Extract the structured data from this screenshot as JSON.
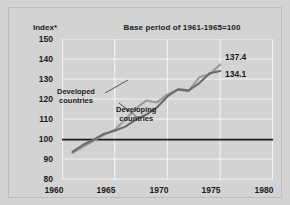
{
  "chart_data": {
    "type": "line",
    "title": "Base period of 1961-1965=100",
    "ylabel": "Index*",
    "xlabel": "",
    "xlim": [
      1960,
      1980
    ],
    "ylim": [
      80,
      150
    ],
    "ytick_labels": [
      "150",
      "140",
      "130",
      "120",
      "110",
      "100",
      "90",
      "80"
    ],
    "yticks": [
      150,
      140,
      130,
      120,
      110,
      100,
      90,
      80
    ],
    "xtick_labels": [
      "1960",
      "1965",
      "1970",
      "1975",
      "1980"
    ],
    "xticks": [
      1960,
      1965,
      1970,
      1975,
      1980
    ],
    "grid": true,
    "legend_position": "inline-annotations",
    "baseline": 100,
    "baseline_color": "#1a1a1a",
    "series": [
      {
        "name": "Developed countries",
        "color": "#9a9a9a",
        "label_text_line1": "Developed",
        "label_text_line2": "countries",
        "end_value_label": "137.4",
        "x": [
          1961,
          1962,
          1963,
          1964,
          1965,
          1966,
          1967,
          1968,
          1969,
          1970,
          1971,
          1972,
          1973,
          1974,
          1975
        ],
        "values": [
          93.5,
          96.5,
          99.5,
          102.5,
          105.0,
          110.0,
          115.5,
          119.5,
          118.5,
          122.5,
          125.0,
          124.0,
          131.0,
          132.5,
          137.4
        ]
      },
      {
        "name": "Developing countries",
        "color": "#6b6b6b",
        "label_text_line1": "Developing",
        "label_text_line2": "countries",
        "end_value_label": "134.1",
        "x": [
          1961,
          1962,
          1963,
          1964,
          1965,
          1966,
          1967,
          1968,
          1969,
          1970,
          1971,
          1972,
          1973,
          1974,
          1975
        ],
        "values": [
          94.0,
          97.5,
          100.0,
          103.0,
          104.5,
          106.5,
          110.0,
          112.5,
          116.0,
          121.5,
          125.0,
          124.5,
          128.0,
          133.0,
          134.1
        ]
      }
    ]
  },
  "labels": {
    "y_axis_caption": "Index*",
    "title": "Base period of 1961-1965=100",
    "ytick_0": "150",
    "ytick_1": "140",
    "ytick_2": "130",
    "ytick_3": "120",
    "ytick_4": "110",
    "ytick_5": "100",
    "ytick_6": "90",
    "ytick_7": "80",
    "xtick_0": "1960",
    "xtick_1": "1965",
    "xtick_2": "1970",
    "xtick_3": "1975",
    "xtick_4": "1980",
    "developed_line1": "Developed",
    "developed_line2": "countries",
    "developing_line1": "Developing",
    "developing_line2": "countries",
    "value_developed": "137.4",
    "value_developing": "134.1"
  },
  "colors": {
    "background": "#d3d3d3",
    "grid": "#f0f0f0",
    "developed": "#9a9a9a",
    "developing": "#6b6b6b",
    "baseline": "#1a1a1a",
    "text": "#1a1a1a"
  }
}
